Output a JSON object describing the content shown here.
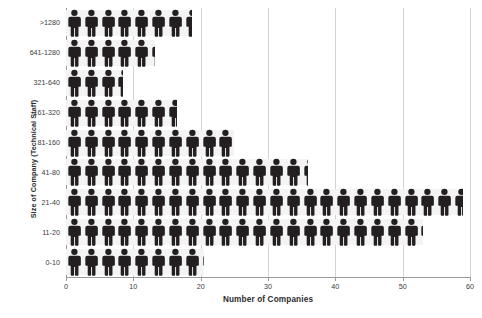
{
  "chart_data": {
    "type": "bar",
    "subtype": "pictogram",
    "title": "",
    "xlabel": "Number of Companies",
    "ylabel": "Size of Company (Technical Staff)",
    "xlim": [
      0,
      60
    ],
    "ylim": null,
    "grid": true,
    "legend": null,
    "icon": "person-icon",
    "icon_unit_value": 2.5,
    "orientation": "horizontal",
    "categories": [
      "0-10",
      "11-20",
      "21-40",
      "41-80",
      "81-160",
      "161-320",
      "321-640",
      "641-1280",
      ">1280"
    ],
    "values": [
      20.5,
      53,
      59,
      36,
      25,
      16.5,
      8.5,
      13.3,
      18.7
    ],
    "icon_counts": [
      8.2,
      21.2,
      23.6,
      14.4,
      10.0,
      6.6,
      3.4,
      5.3,
      7.5
    ],
    "xticks": [
      0,
      10,
      20,
      30,
      40,
      50,
      60
    ],
    "xticklabels": [
      "0",
      "10",
      "20",
      "30",
      "40",
      "50",
      "60"
    ],
    "yticklabels": [
      ">1280",
      "641-1280",
      "321-640",
      "161-320",
      "81-160",
      "41-80",
      "21-40",
      "11-20",
      "0-10"
    ],
    "series": [
      {
        "name": "Number of Companies",
        "values": [
          20.5,
          53,
          59,
          36,
          25,
          16.5,
          8.5,
          13.3,
          18.7
        ]
      }
    ],
    "colors": {
      "icon": "#231f20",
      "gridline": "#d3d3d3",
      "axis": "#9a9a9a",
      "row_band": "#f4f4f4",
      "text": "#3b3b3b",
      "background": "#ffffff"
    }
  }
}
